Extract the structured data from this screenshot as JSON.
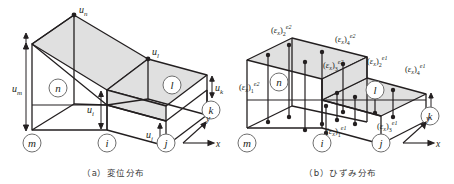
{
  "figure": {
    "panels": [
      {
        "id": "a",
        "caption_index": "（a）",
        "caption_text": "変位分布",
        "axes": {
          "x": "x",
          "y": "y"
        },
        "element_labels": [
          {
            "name": "n",
            "text": "n"
          },
          {
            "name": "l",
            "text": "l"
          }
        ],
        "node_labels": [
          {
            "name": "m",
            "text": "m"
          },
          {
            "name": "i",
            "text": "i"
          },
          {
            "name": "j",
            "text": "j"
          },
          {
            "name": "k",
            "text": "k"
          }
        ],
        "displacement_labels": [
          {
            "name": "u-n",
            "base": "u",
            "sub": "n"
          },
          {
            "name": "u-l",
            "base": "u",
            "sub": "l"
          },
          {
            "name": "u-m",
            "base": "u",
            "sub": "m"
          },
          {
            "name": "u-i",
            "base": "u",
            "sub": "i"
          },
          {
            "name": "u-j",
            "base": "u",
            "sub": "j"
          },
          {
            "name": "u-k",
            "base": "u",
            "sub": "k"
          }
        ]
      },
      {
        "id": "b",
        "caption_index": "（b）",
        "caption_text": "ひずみ分布",
        "axes": {
          "x": "x",
          "y": "y"
        },
        "element_labels": [
          {
            "name": "n",
            "text": "n"
          },
          {
            "name": "l",
            "text": "l"
          }
        ],
        "node_labels": [
          {
            "name": "m",
            "text": "m"
          },
          {
            "name": "i",
            "text": "i"
          },
          {
            "name": "j",
            "text": "j"
          },
          {
            "name": "k",
            "text": "k"
          }
        ],
        "strain_labels": [
          {
            "name": "eps-2-e2",
            "open": "(",
            "sym": "ε",
            "symsub": "x",
            "close": ")",
            "sub": "2",
            "sup": "e2"
          },
          {
            "name": "eps-4-e2",
            "open": "(",
            "sym": "ε",
            "symsub": "x",
            "close": ")",
            "sub": "4",
            "sup": "e2"
          },
          {
            "name": "eps-3-e2",
            "open": "(",
            "sym": "ε",
            "symsub": "x",
            "close": ")",
            "sub": "3",
            "sup": "e2"
          },
          {
            "name": "eps-1-e2",
            "open": "(",
            "sym": "ε",
            "symsub": "x",
            "close": ")",
            "sub": "1",
            "sup": "e2"
          },
          {
            "name": "eps-2-e1",
            "open": "(",
            "sym": "ε",
            "symsub": "x",
            "close": ")",
            "sub": "2",
            "sup": "e1"
          },
          {
            "name": "eps-4-e1",
            "open": "(",
            "sym": "ε",
            "symsub": "x",
            "close": ")",
            "sub": "4",
            "sup": "e1"
          },
          {
            "name": "eps-1-e1",
            "open": "(",
            "sym": "ε",
            "symsub": "x",
            "close": ")",
            "sub": "1",
            "sup": "e1"
          },
          {
            "name": "eps-3-e1",
            "open": "(",
            "sym": "ε",
            "symsub": "x",
            "close": ")",
            "sub": "3",
            "sup": "e1"
          }
        ]
      }
    ],
    "colors": {
      "line": "#231f20",
      "surface_fill": "#e0e0e0",
      "thin_line": "#6f6f6f",
      "background": "#ffffff"
    }
  }
}
